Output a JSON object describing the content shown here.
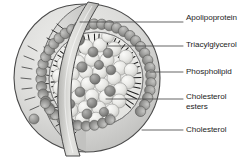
{
  "figure": {
    "background_color": "#ffffff",
    "width": 241,
    "height": 157
  },
  "colors": {
    "outline": "#3b3b3b",
    "leader_line": "#4a4a4a",
    "label_text": "#1c1c1c",
    "shell_fill": "#d8d8d6",
    "shell_inner_fill": "#c9c9c7",
    "phospholipid_head": "#9a9a99",
    "phospholipid_head_dark": "#848483",
    "phospholipid_tail": "#2e2e2e",
    "triacylglycerol": "#e6e6e4",
    "cholesterol_ester": "#8c8c8b",
    "apolipoprotein_band": "#cfcfcd",
    "core_background": "#efefed"
  },
  "labels": [
    {
      "id": "apolipoprotein",
      "text": "Apolipoprotein",
      "lines": [
        "Apolipoprotein"
      ],
      "leader": {
        "x1": 80,
        "y1": 22,
        "x2": 183,
        "y2": 22
      },
      "anchor_description": "curved ribbon crossing the particle surface"
    },
    {
      "id": "triacylglycerol",
      "text": "Triacylglycerol",
      "lines": [
        "Triacylglycerol"
      ],
      "leader": {
        "x1": 108,
        "y1": 46,
        "x2": 183,
        "y2": 46
      },
      "anchor_description": "pale spheres filling the hydrophobic core"
    },
    {
      "id": "phospholipid",
      "text": "Phospholipid",
      "lines": [
        "Phospholipid"
      ],
      "leader": {
        "x1": 150,
        "y1": 72,
        "x2": 183,
        "y2": 72
      },
      "anchor_description": "head-and-tail units of the surface monolayer"
    },
    {
      "id": "cholesterol-esters",
      "text": "Cholesterol esters",
      "lines": [
        "Cholesterol",
        "esters"
      ],
      "leader": {
        "x1": 106,
        "y1": 99,
        "x2": 183,
        "y2": 99
      },
      "anchor_description": "darker spheres scattered through the core"
    },
    {
      "id": "cholesterol",
      "text": "Cholesterol",
      "lines": [
        "Cholesterol"
      ],
      "leader": {
        "x1": 142,
        "y1": 130,
        "x2": 183,
        "y2": 130
      },
      "anchor_description": "sphere embedded in the outer shell"
    }
  ],
  "structure": {
    "particle_name": "lipoprotein-particle",
    "components": [
      "outer-shell-cutaway",
      "phospholipid-monolayer",
      "apolipoprotein-ribbon",
      "triacylglycerol-core",
      "cholesterol-ester-spheres",
      "cholesterol-spheres"
    ]
  }
}
